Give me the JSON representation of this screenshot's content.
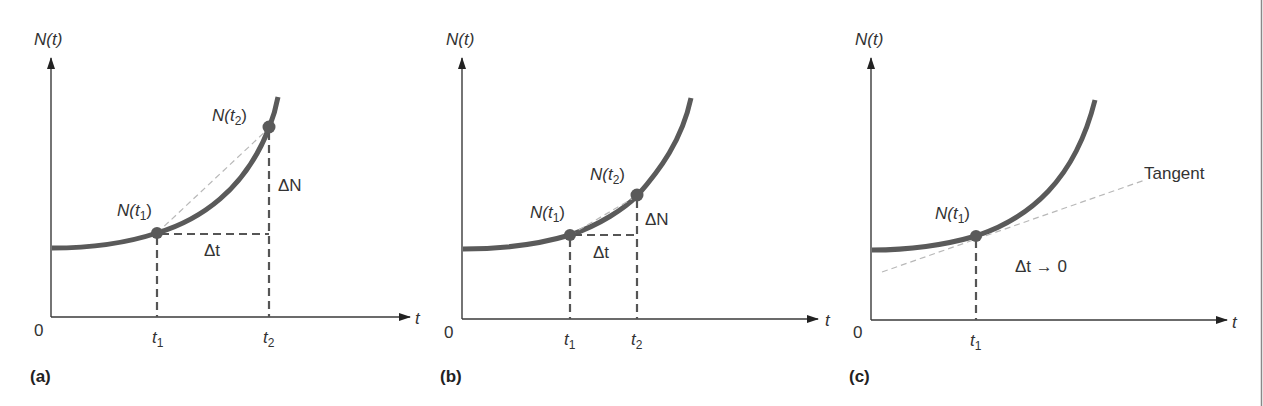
{
  "figure": {
    "panels": [
      {
        "id": "a",
        "label": "(a)",
        "y_axis_label": "N(t)",
        "x_axis_label": "t",
        "origin_label": "0",
        "point1_label_main": "N(t",
        "point1_label_sub": "1",
        "point1_label_close": ")",
        "point2_label_main": "N(t",
        "point2_label_sub": "2",
        "point2_label_close": ")",
        "delta_n_label": "ΔN",
        "delta_t_label": "Δt",
        "tick1_main": "t",
        "tick1_sub": "1",
        "tick2_main": "t",
        "tick2_sub": "2"
      },
      {
        "id": "b",
        "label": "(b)",
        "y_axis_label": "N(t)",
        "x_axis_label": "t",
        "origin_label": "0",
        "point1_label_main": "N(t",
        "point1_label_sub": "1",
        "point1_label_close": ")",
        "point2_label_main": "N(t",
        "point2_label_sub": "2",
        "point2_label_close": ")",
        "delta_n_label": "ΔN",
        "delta_t_label": "Δt",
        "tick1_main": "t",
        "tick1_sub": "1",
        "tick2_main": "t",
        "tick2_sub": "2"
      },
      {
        "id": "c",
        "label": "(c)",
        "y_axis_label": "N(t)",
        "x_axis_label": "t",
        "origin_label": "0",
        "point1_label_main": "N(t",
        "point1_label_sub": "1",
        "point1_label_close": ")",
        "tangent_label": "Tangent",
        "limit_label": "Δt → 0",
        "tick1_main": "t",
        "tick1_sub": "1"
      }
    ],
    "colors": {
      "curve": "#5a5a5a",
      "axis": "#3a3a3a",
      "dashed_guides": "#555555",
      "secant_tangent": "#b8b8b8",
      "text": "#333333"
    }
  }
}
